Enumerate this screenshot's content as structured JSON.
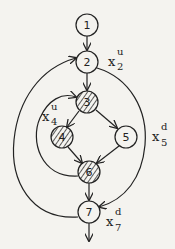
{
  "diagram": {
    "type": "control-flow-graph",
    "nodes": [
      {
        "id": "1",
        "label": "1",
        "x": 87,
        "y": 25,
        "hatched": false
      },
      {
        "id": "2",
        "label": "2",
        "x": 87,
        "y": 62,
        "hatched": false
      },
      {
        "id": "3",
        "label": "3",
        "x": 87,
        "y": 102,
        "hatched": true
      },
      {
        "id": "4",
        "label": "4",
        "x": 62,
        "y": 137,
        "hatched": true
      },
      {
        "id": "5",
        "label": "5",
        "x": 126,
        "y": 137,
        "hatched": false
      },
      {
        "id": "6",
        "label": "6",
        "x": 89,
        "y": 172,
        "hatched": true
      },
      {
        "id": "7",
        "label": "7",
        "x": 89,
        "y": 212,
        "hatched": false
      }
    ],
    "edges": [
      {
        "from": "1",
        "to": "2"
      },
      {
        "from": "2",
        "to": "3"
      },
      {
        "from": "3",
        "to": "4"
      },
      {
        "from": "3",
        "to": "5"
      },
      {
        "from": "4",
        "to": "6"
      },
      {
        "from": "5",
        "to": "6"
      },
      {
        "from": "6",
        "to": "7"
      },
      {
        "from": "6",
        "to": "3",
        "kind": "back-loop-left"
      },
      {
        "from": "7",
        "to": "2",
        "kind": "back-loop-left"
      },
      {
        "from": "2",
        "to": "7",
        "kind": "arc-right"
      },
      {
        "from": "7",
        "to": "exit"
      }
    ],
    "labels": [
      {
        "id": "x2u",
        "base": "x",
        "sub": "2",
        "sup": "u",
        "x": 108,
        "y": 63
      },
      {
        "id": "x4u",
        "base": "x",
        "sub": "4",
        "sup": "u",
        "x": 42,
        "y": 118
      },
      {
        "id": "x5d",
        "base": "x",
        "sub": "5",
        "sup": "d",
        "x": 152,
        "y": 138
      },
      {
        "id": "x7d",
        "base": "x",
        "sub": "7",
        "sup": "d",
        "x": 106,
        "y": 223
      }
    ]
  }
}
